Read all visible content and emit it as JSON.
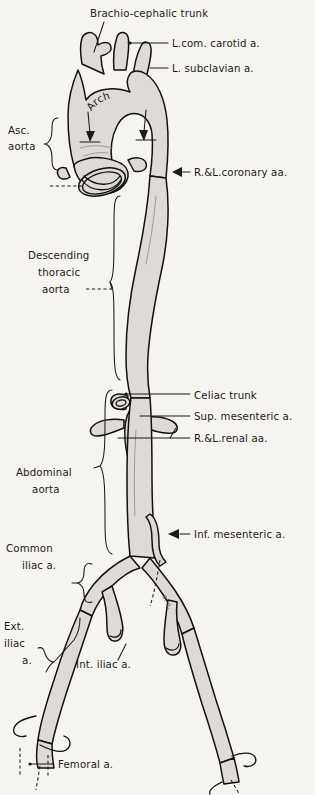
{
  "figure": {
    "name": "aorta-and-branches-diagram",
    "style": "hand-drawn anatomical line illustration, gray-shaded vessels on off-white paper",
    "colors": {
      "paper": "#f6f4f0",
      "vessel_fill": "#dedad5",
      "ink": "#1a1a1a",
      "shading": "#8e8a85"
    }
  },
  "labels": {
    "brachiocephalic_trunk": "Brachio-cephalic trunk",
    "l_com_carotid": "L.com. carotid a.",
    "l_subclavian": "L. subclavian a.",
    "arch": "Arch",
    "asc_aorta_line1": "Asc.",
    "asc_aorta_line2": "aorta",
    "coronary": "R.&L.coronary aa.",
    "desc_thoracic_line1": "Descending",
    "desc_thoracic_line2": "thoracic",
    "desc_thoracic_line3": "aorta",
    "celiac_trunk": "Celiac trunk",
    "sup_mesenteric": "Sup. mesenteric a.",
    "renal": "R.&L.renal aa.",
    "abdominal_line1": "Abdominal",
    "abdominal_line2": "aorta",
    "inf_mesenteric": "Inf. mesenteric a.",
    "common_iliac_line1": "Common",
    "common_iliac_line2": "iliac a.",
    "ext_iliac_line1": "Ext.",
    "ext_iliac_line2": "iliac",
    "ext_iliac_line3": "a.",
    "int_iliac": "Int. iliac a.",
    "femoral": "Femoral a."
  },
  "structures": [
    {
      "name": "brachiocephalic-trunk",
      "region": "aortic-arch",
      "side": "right"
    },
    {
      "name": "left-common-carotid-artery",
      "region": "aortic-arch",
      "side": "left"
    },
    {
      "name": "left-subclavian-artery",
      "region": "aortic-arch",
      "side": "left"
    },
    {
      "name": "aortic-arch",
      "region": "thorax"
    },
    {
      "name": "ascending-aorta",
      "region": "thorax"
    },
    {
      "name": "aortic-valve-cusps",
      "region": "aortic-root"
    },
    {
      "name": "right-and-left-coronary-arteries",
      "region": "aortic-root"
    },
    {
      "name": "descending-thoracic-aorta",
      "region": "thorax"
    },
    {
      "name": "celiac-trunk",
      "region": "abdomen"
    },
    {
      "name": "superior-mesenteric-artery",
      "region": "abdomen"
    },
    {
      "name": "right-and-left-renal-arteries",
      "region": "abdomen"
    },
    {
      "name": "abdominal-aorta",
      "region": "abdomen"
    },
    {
      "name": "inferior-mesenteric-artery",
      "region": "abdomen"
    },
    {
      "name": "common-iliac-artery",
      "region": "pelvis"
    },
    {
      "name": "external-iliac-artery",
      "region": "pelvis"
    },
    {
      "name": "internal-iliac-artery",
      "region": "pelvis"
    },
    {
      "name": "femoral-artery",
      "region": "thigh"
    }
  ]
}
